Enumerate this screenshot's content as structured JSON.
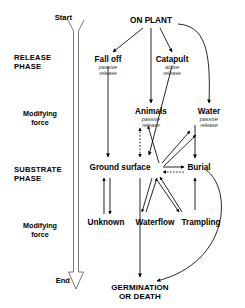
{
  "diagram": {
    "type": "flow-diagram",
    "width": 245,
    "height": 308,
    "colors": {
      "ink": "#000000",
      "subtitle": "#3a3a3a",
      "background": "#ffffff"
    }
  },
  "timeline": {
    "start_label": "Start",
    "end_label": "End",
    "arrow_name": "time-axis-arrow"
  },
  "phases": [
    {
      "id": "release",
      "line1": "RELEASE",
      "line2": "PHASE"
    },
    {
      "id": "substrate",
      "line1": "SUBSTRATE",
      "line2": "PHASE"
    }
  ],
  "modifiers": [
    {
      "id": "modifier-upper",
      "line1": "Modifying",
      "line2": "force"
    },
    {
      "id": "modifier-lower",
      "line1": "Modifying",
      "line2": "force"
    }
  ],
  "nodes": [
    {
      "id": "on-plant",
      "label": "ON PLANT",
      "sub1": "",
      "sub2": ""
    },
    {
      "id": "fall-off",
      "label": "Fall off",
      "sub1": "passive",
      "sub2": "release"
    },
    {
      "id": "catapult",
      "label": "Catapult",
      "sub1": "active",
      "sub2": "release"
    },
    {
      "id": "animals",
      "label": "Animals",
      "sub1": "passive",
      "sub2": "release"
    },
    {
      "id": "water",
      "label": "Water",
      "sub1": "passive",
      "sub2": "release"
    },
    {
      "id": "ground-surface",
      "label": "Ground surface",
      "sub1": "",
      "sub2": ""
    },
    {
      "id": "burial",
      "label": "Burial",
      "sub1": "",
      "sub2": ""
    },
    {
      "id": "unknown",
      "label": "Unknown",
      "sub1": "",
      "sub2": ""
    },
    {
      "id": "waterflow",
      "label": "Waterflow",
      "sub1": "",
      "sub2": ""
    },
    {
      "id": "trampling",
      "label": "Trampling",
      "sub1": "",
      "sub2": ""
    }
  ],
  "terminal": {
    "line1": "GERMINATION",
    "line2": "OR DEATH"
  },
  "subtitles": {
    "fall_off_1": "passive",
    "fall_off_2": "release",
    "catapult_1": "active",
    "catapult_2": "release",
    "animals_1": "passive",
    "animals_2": "release",
    "water_1": "passive",
    "water_2": "release"
  },
  "edges": [
    {
      "from": "on-plant",
      "to": "fall-off",
      "style": "solid",
      "heads": 1
    },
    {
      "from": "on-plant",
      "to": "catapult",
      "style": "solid",
      "heads": 1
    },
    {
      "from": "on-plant",
      "to": "animals",
      "style": "solid",
      "heads": 1
    },
    {
      "from": "on-plant",
      "to": "water",
      "style": "solid",
      "heads": 1
    },
    {
      "from": "fall-off",
      "to": "ground-surface",
      "style": "solid",
      "heads": 1
    },
    {
      "from": "catapult",
      "to": "ground-surface",
      "style": "solid",
      "heads": 1
    },
    {
      "from": "animals",
      "to": "ground-surface",
      "style": "dashed",
      "heads": 2
    },
    {
      "from": "water",
      "to": "burial",
      "style": "solid",
      "heads": 1
    },
    {
      "from": "ground-surface",
      "to": "burial",
      "style": "solid",
      "heads": 2
    },
    {
      "from": "ground-surface",
      "to": "unknown",
      "style": "solid",
      "heads": 2
    },
    {
      "from": "ground-surface",
      "to": "waterflow",
      "style": "solid",
      "heads": 2
    },
    {
      "from": "ground-surface",
      "to": "trampling",
      "style": "solid",
      "heads": 2
    },
    {
      "from": "ground-surface",
      "to": "animals",
      "style": "solid",
      "heads": 1
    },
    {
      "from": "ground-surface",
      "to": "water",
      "style": "solid",
      "heads": 1
    },
    {
      "from": "burial",
      "to": "trampling",
      "style": "solid",
      "heads": 1
    },
    {
      "from": "ground-surface",
      "to": "terminal",
      "style": "solid",
      "heads": 1
    },
    {
      "from": "burial",
      "to": "terminal",
      "style": "solid",
      "heads": 1
    }
  ]
}
